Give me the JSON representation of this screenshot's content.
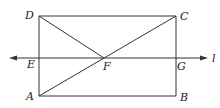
{
  "diagram": {
    "type": "geometry",
    "shape": "rectangle ABCD with diagonals to F and line l",
    "points": {
      "A": {
        "label": "A",
        "x": 39,
        "y": 96
      },
      "B": {
        "label": "B",
        "x": 176,
        "y": 96
      },
      "C": {
        "label": "C",
        "x": 176,
        "y": 16
      },
      "D": {
        "label": "D",
        "x": 39,
        "y": 16
      },
      "E": {
        "label": "E",
        "x": 39,
        "y": 58
      },
      "F": {
        "label": "F",
        "x": 104,
        "y": 58
      },
      "G": {
        "label": "G",
        "x": 176,
        "y": 58
      }
    },
    "line": {
      "label": "l",
      "x1": 9,
      "x2": 208,
      "y": 58
    },
    "segments": [
      "AB",
      "BC",
      "CD",
      "DA",
      "DF",
      "AC"
    ],
    "color": "#333333"
  }
}
